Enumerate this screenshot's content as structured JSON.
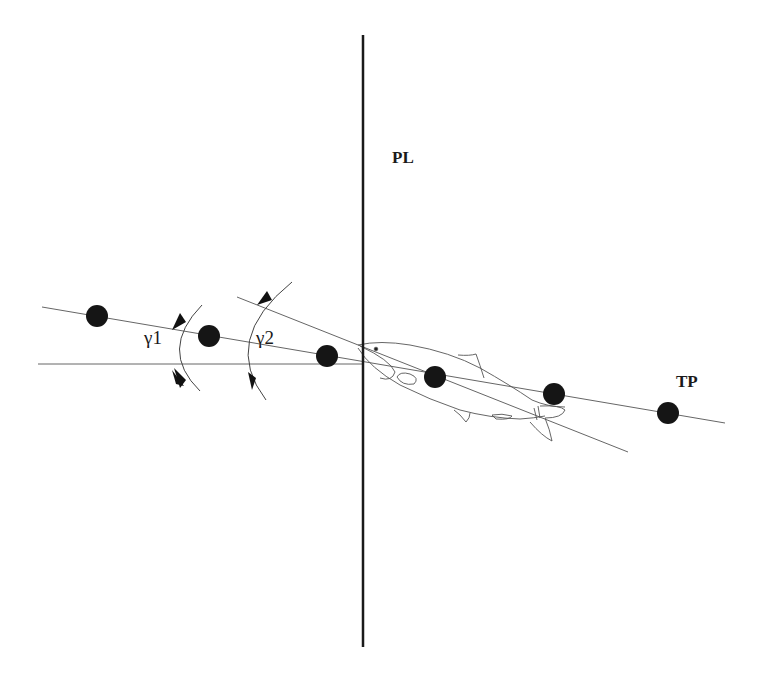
{
  "diagram": {
    "labels": {
      "plane": "PL",
      "trajectory": "TP",
      "angle1": "γ1",
      "angle2": "γ2"
    },
    "colors": {
      "stroke": "#1a1a1a",
      "thin_line": "#555555",
      "dot": "#151515"
    },
    "plane_line": {
      "x": 363,
      "y1": 35,
      "y2": 647
    },
    "trajectory_line": {
      "x1": 42,
      "y1": 307,
      "x2": 725,
      "y2": 423
    },
    "horizontal_line": {
      "x1": 38,
      "y1": 364,
      "x2": 363,
      "y2": 364
    },
    "body_axis_line": {
      "x1": 237,
      "y1": 297,
      "x2": 628,
      "y2": 452
    },
    "dots": [
      {
        "cx": 97,
        "cy": 316
      },
      {
        "cx": 209,
        "cy": 336
      },
      {
        "cx": 327,
        "cy": 356
      },
      {
        "cx": 435,
        "cy": 377
      },
      {
        "cx": 554,
        "cy": 394
      },
      {
        "cx": 668,
        "cy": 413
      }
    ],
    "dot_radius": 11
  }
}
